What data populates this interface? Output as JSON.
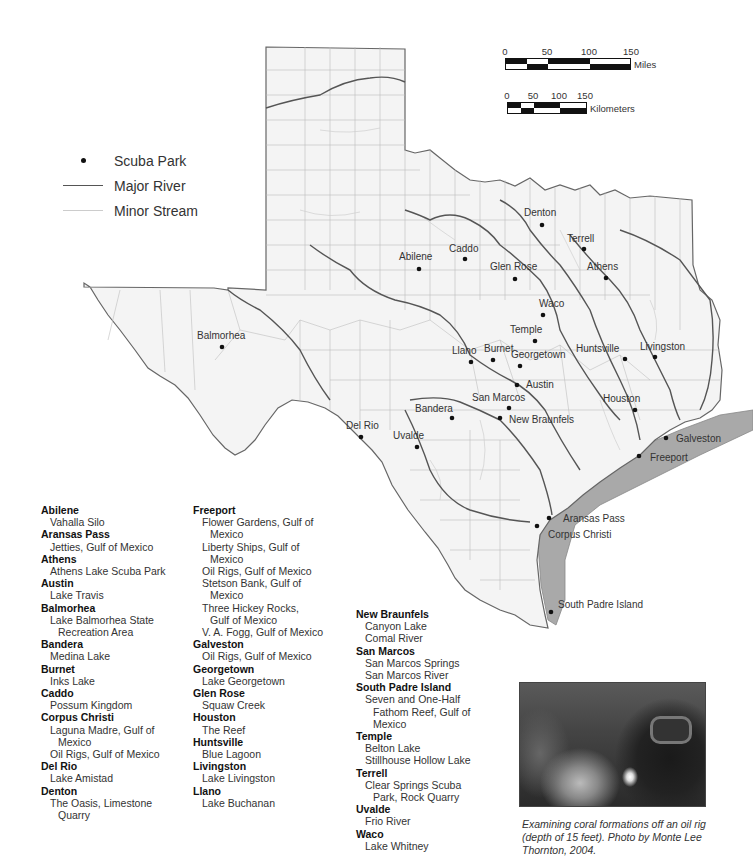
{
  "legend": {
    "items": [
      {
        "symbol": "dot",
        "label": "Scuba Park"
      },
      {
        "symbol": "major-line",
        "label": "Major River"
      },
      {
        "symbol": "minor-line",
        "label": "Minor Stream"
      }
    ]
  },
  "scale_bars": {
    "miles": {
      "ticks": [
        "0",
        "50",
        "100",
        "150"
      ],
      "unit": "Miles"
    },
    "kilometers": {
      "ticks": [
        "0",
        "50",
        "100",
        "150"
      ],
      "unit": "Kilometers"
    }
  },
  "map_labels": [
    {
      "name": "Denton",
      "x": 542,
      "y": 225
    },
    {
      "name": "Terrell",
      "x": 584,
      "y": 249
    },
    {
      "name": "Abilene",
      "x": 419,
      "y": 269
    },
    {
      "name": "Caddo",
      "x": 465,
      "y": 259
    },
    {
      "name": "Glen Rose",
      "x": 515,
      "y": 279
    },
    {
      "name": "Athens",
      "x": 606,
      "y": 278
    },
    {
      "name": "Waco",
      "x": 543,
      "y": 315
    },
    {
      "name": "Temple",
      "x": 535,
      "y": 341
    },
    {
      "name": "Balmorhea",
      "x": 222,
      "y": 347
    },
    {
      "name": "Llano",
      "x": 471,
      "y": 362
    },
    {
      "name": "Burnet",
      "x": 493,
      "y": 360
    },
    {
      "name": "Georgetown",
      "x": 520,
      "y": 366
    },
    {
      "name": "Huntsville",
      "x": 625,
      "y": 359
    },
    {
      "name": "Livingston",
      "x": 655,
      "y": 357
    },
    {
      "name": "Austin",
      "x": 517,
      "y": 385
    },
    {
      "name": "Houston",
      "x": 635,
      "y": 410
    },
    {
      "name": "San Marcos",
      "x": 509,
      "y": 408
    },
    {
      "name": "Bandera",
      "x": 452,
      "y": 418
    },
    {
      "name": "New Braunfels",
      "x": 500,
      "y": 418
    },
    {
      "name": "Del Rio",
      "x": 361,
      "y": 437
    },
    {
      "name": "Uvalde",
      "x": 417,
      "y": 447
    },
    {
      "name": "Galveston",
      "x": 666,
      "y": 438
    },
    {
      "name": "Freeport",
      "x": 639,
      "y": 456
    },
    {
      "name": "Aransas Pass",
      "x": 549,
      "y": 518
    },
    {
      "name": "Corpus Christi",
      "x": 537,
      "y": 526
    },
    {
      "name": "South Padre Island",
      "x": 551,
      "y": 612
    }
  ],
  "directory": {
    "columns": [
      [
        {
          "city": "Abilene",
          "sites": [
            [
              "Vahalla Silo"
            ]
          ]
        },
        {
          "city": "Aransas Pass",
          "sites": [
            [
              "Jetties, Gulf of Mexico"
            ]
          ]
        },
        {
          "city": "Athens",
          "sites": [
            [
              "Athens Lake Scuba Park"
            ]
          ]
        },
        {
          "city": "Austin",
          "sites": [
            [
              "Lake Travis"
            ]
          ]
        },
        {
          "city": "Balmorhea",
          "sites": [
            [
              "Lake Balmorhea State",
              "Recreation Area"
            ]
          ]
        },
        {
          "city": "Bandera",
          "sites": [
            [
              "Medina Lake"
            ]
          ]
        },
        {
          "city": "Burnet",
          "sites": [
            [
              "Inks Lake"
            ]
          ]
        },
        {
          "city": "Caddo",
          "sites": [
            [
              "Possum Kingdom"
            ]
          ]
        },
        {
          "city": "Corpus Christi",
          "sites": [
            [
              "Laguna Madre, Gulf of",
              "Mexico"
            ],
            [
              "Oil Rigs, Gulf of Mexico"
            ]
          ]
        },
        {
          "city": "Del Rio",
          "sites": [
            [
              "Lake Amistad"
            ]
          ]
        },
        {
          "city": "Denton",
          "sites": [
            [
              "The Oasis, Limestone",
              "Quarry"
            ]
          ]
        }
      ],
      [
        {
          "city": "Freeport",
          "sites": [
            [
              "Flower Gardens, Gulf of",
              "Mexico"
            ],
            [
              "Liberty Ships, Gulf of",
              "Mexico"
            ],
            [
              "Oil Rigs, Gulf of Mexico"
            ],
            [
              "Stetson Bank, Gulf of",
              "Mexico"
            ],
            [
              "Three Hickey Rocks,",
              "Gulf of Mexico"
            ],
            [
              "V. A. Fogg, Gulf of Mexico"
            ]
          ]
        },
        {
          "city": "Galveston",
          "sites": [
            [
              "Oil Rigs, Gulf of Mexico"
            ]
          ]
        },
        {
          "city": "Georgetown",
          "sites": [
            [
              "Lake Georgetown"
            ]
          ]
        },
        {
          "city": "Glen Rose",
          "sites": [
            [
              "Squaw Creek"
            ]
          ]
        },
        {
          "city": "Houston",
          "sites": [
            [
              "The Reef"
            ]
          ]
        },
        {
          "city": "Huntsville",
          "sites": [
            [
              "Blue Lagoon"
            ]
          ]
        },
        {
          "city": "Livingston",
          "sites": [
            [
              "Lake Livingston"
            ]
          ]
        },
        {
          "city": "Llano",
          "sites": [
            [
              "Lake Buchanan"
            ]
          ]
        }
      ],
      [
        {
          "city": "New Braunfels",
          "sites": [
            [
              "Canyon Lake"
            ],
            [
              "Comal River"
            ]
          ]
        },
        {
          "city": "San Marcos",
          "sites": [
            [
              "San Marcos Springs"
            ],
            [
              "San Marcos River"
            ]
          ]
        },
        {
          "city": "South Padre Island",
          "sites": [
            [
              "Seven and One-Half",
              "Fathom Reef, Gulf of",
              "Mexico"
            ]
          ]
        },
        {
          "city": "Temple",
          "sites": [
            [
              "Belton Lake"
            ],
            [
              "Stillhouse Hollow Lake"
            ]
          ]
        },
        {
          "city": "Terrell",
          "sites": [
            [
              "Clear Springs Scuba",
              "Park, Rock Quarry"
            ]
          ]
        },
        {
          "city": "Uvalde",
          "sites": [
            [
              "Frio River"
            ]
          ]
        },
        {
          "city": "Waco",
          "sites": [
            [
              "Lake Whitney"
            ]
          ]
        }
      ]
    ]
  },
  "photo": {
    "alt": "Diver with mask and light examining coral formations",
    "caption": "Examining coral formations off an oil rig (depth of 15 feet). Photo by Monte Lee Thornton, 2004."
  },
  "colors": {
    "land": "#f4f4f4",
    "gulf_band": "#a9a9a9",
    "major_river": "#555555",
    "minor_stream": "#c8c8c8",
    "county_line": "#b5b5b5",
    "dot": "#111111"
  }
}
